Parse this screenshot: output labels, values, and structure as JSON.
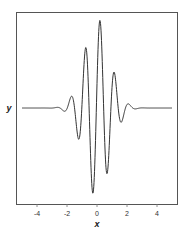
{
  "chart_data": {
    "type": "line",
    "title": "",
    "xlabel": "x",
    "ylabel": "y",
    "xlim": [
      -5.3,
      5.4
    ],
    "ylim": [
      -1.0,
      1.0
    ],
    "grid": false,
    "legend": null,
    "x_ticks": [
      -4,
      -2,
      0,
      2,
      4
    ],
    "x_tick_labels": [
      "-4",
      "-2",
      "0",
      "2",
      "4"
    ],
    "y_ticks": [],
    "model": {
      "sigma": 0.85,
      "period": 0.97,
      "phase_shift": 0.2,
      "amplitude": 1.0,
      "x_range": [
        -5,
        5
      ]
    },
    "series": [
      {
        "name": "y",
        "color": "#333333",
        "x": [
          -5,
          -4,
          -3,
          -2.5,
          -2,
          -1.75,
          -1.5,
          -1.25,
          -1,
          -0.75,
          -0.5,
          -0.25,
          0,
          0.25,
          0.5,
          0.75,
          1,
          1.25,
          1.5,
          1.75,
          2,
          2.5,
          3,
          4,
          5
        ],
        "values": [
          0,
          0,
          0,
          0.003,
          -0.007,
          0.12,
          0.003,
          -0.339,
          0.04,
          0.669,
          -0.15,
          -0.934,
          0.271,
          0.908,
          -0.306,
          -0.619,
          0.226,
          0.295,
          -0.114,
          -0.098,
          0.039,
          -0.009,
          0,
          0,
          0
        ]
      }
    ]
  },
  "colors": {
    "line": "#333333",
    "frame": "#555555",
    "background": "#ffffff"
  }
}
